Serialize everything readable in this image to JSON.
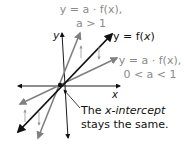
{
  "labels": {
    "top_eq": "y = a · f(x),",
    "top_cond": "a > 1",
    "base_eq_prefix": "y = f(",
    "base_eq_var": "x",
    "base_eq_suffix": ")",
    "low_eq": "y = a · f(x),",
    "low_cond": "0 < a < 1",
    "x_axis": "x",
    "y_axis": "y",
    "note_line1_prefix": "The ",
    "note_line1_italic": "x-intercept",
    "note_line2": "stays the same."
  },
  "colors": {
    "axis": "#1a1a1a",
    "base_line": "#111111",
    "transformed_line": "#808080",
    "label_gray": "#8a8a8a"
  },
  "lines": [
    {
      "name": "x-axis",
      "from": [
        120,
        86
      ],
      "to": [
        18,
        86
      ]
    },
    {
      "name": "y-axis",
      "from": [
        68,
        138
      ],
      "to": [
        62,
        33
      ]
    },
    {
      "name": "y = f(x)",
      "from": [
        18,
        132
      ],
      "to": [
        112,
        34
      ]
    },
    {
      "name": "y = a·f(x), a > 1",
      "from": [
        38,
        138
      ],
      "to": [
        80,
        33
      ]
    },
    {
      "name": "y = a·f(x), 0 < a < 1",
      "from": [
        20,
        104
      ],
      "to": [
        117,
        58
      ]
    }
  ]
}
